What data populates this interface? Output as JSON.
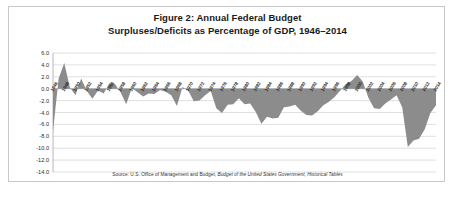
{
  "figure": {
    "title_line1": "Figure 2: Annual Federal Budget",
    "title_line2": "Surpluses/Deficits as Percentage of GDP, 1946–2014",
    "source_prefix": "Source: U.S. Office of Management and Budget, ",
    "source_italic": "Budget of the United States Government, Historical Tables",
    "border_color": "#c8c8c8",
    "series_color": "#8c8c8c",
    "grid_color": "#c9c9c9"
  },
  "chart_data": {
    "type": "area",
    "title": "Figure 2: Annual Federal Budget Surpluses/Deficits as Percentage of GDP, 1946–2014",
    "xlabel": "",
    "ylabel": "",
    "ylim": [
      -14.0,
      6.0
    ],
    "ytick_step": 2.0,
    "grid": true,
    "legend": "none",
    "yticks": [
      "6.0",
      "4.0",
      "2.0",
      "0.0",
      "-2.0",
      "-4.0",
      "-6.0",
      "-8.0",
      "-10.0",
      "-12.0",
      "-14.0"
    ],
    "xtick_labels": [
      "1946",
      "1948",
      "1950",
      "1952",
      "1954",
      "1956",
      "1958",
      "1960",
      "1962",
      "1964",
      "1966",
      "1968",
      "1970",
      "1972",
      "1974",
      "1976",
      "1978",
      "1980",
      "1982",
      "1984",
      "1986",
      "1988",
      "1990",
      "1992",
      "1994",
      "1996",
      "1998",
      "2000",
      "2002",
      "2004",
      "2006",
      "2008",
      "2010",
      "2012",
      "2014"
    ],
    "x": [
      1946,
      1947,
      1948,
      1949,
      1950,
      1951,
      1952,
      1953,
      1954,
      1955,
      1956,
      1957,
      1958,
      1959,
      1960,
      1961,
      1962,
      1963,
      1964,
      1965,
      1966,
      1967,
      1968,
      1969,
      1970,
      1971,
      1972,
      1973,
      1974,
      1975,
      1976,
      1977,
      1978,
      1979,
      1980,
      1981,
      1982,
      1983,
      1984,
      1985,
      1986,
      1987,
      1988,
      1989,
      1990,
      1991,
      1992,
      1993,
      1994,
      1995,
      1996,
      1997,
      1998,
      1999,
      2000,
      2001,
      2002,
      2003,
      2004,
      2005,
      2006,
      2007,
      2008,
      2009,
      2010,
      2011,
      2012,
      2013,
      2014
    ],
    "values": [
      -7.2,
      1.7,
      4.3,
      0.2,
      -1.1,
      1.7,
      -0.4,
      -1.7,
      -0.3,
      -0.8,
      0.9,
      0.8,
      -0.6,
      -2.6,
      0.1,
      -0.6,
      -1.3,
      -0.8,
      -0.9,
      -0.2,
      -0.5,
      -1.1,
      -2.9,
      0.3,
      -0.3,
      -2.1,
      -2.0,
      -1.1,
      -0.4,
      -3.3,
      -4.1,
      -2.7,
      -2.6,
      -1.6,
      -2.6,
      -2.5,
      -3.9,
      -5.9,
      -4.7,
      -5.0,
      -4.9,
      -3.1,
      -3.0,
      -2.7,
      -3.7,
      -4.4,
      -4.5,
      -3.8,
      -2.8,
      -2.2,
      -1.4,
      -0.3,
      0.8,
      1.3,
      2.3,
      1.2,
      -1.5,
      -3.3,
      -3.4,
      -2.5,
      -1.8,
      -1.1,
      -3.1,
      -9.8,
      -8.7,
      -8.4,
      -6.8,
      -4.1,
      -2.8
    ]
  }
}
